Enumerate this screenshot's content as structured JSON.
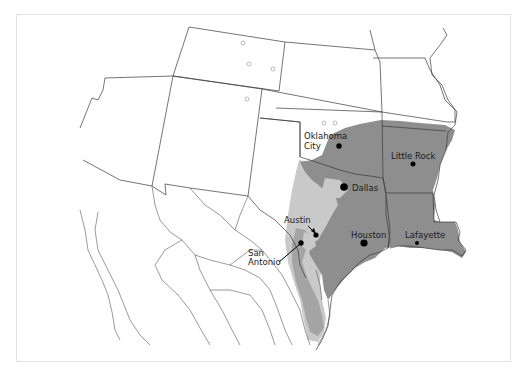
{
  "map": {
    "title": "",
    "colors": {
      "background": "#ffffff",
      "frame": "#e2e2e2",
      "border_line": "#3a3a3a",
      "dark_zone": "#8e8e8e",
      "medium_zone": "#a4a4a4",
      "light_zone": "#c9c9c9",
      "city_dot": "#000000"
    },
    "cities": [
      {
        "name": "Oklahoma City",
        "line1": "Oklahoma",
        "line2": "City",
        "x": 339,
        "y": 146
      },
      {
        "name": "Little Rock",
        "line1": "Little Rock",
        "x": 413,
        "y": 164
      },
      {
        "name": "Dallas",
        "line1": "Dallas",
        "x": 344,
        "y": 187
      },
      {
        "name": "Austin",
        "line1": "Austin",
        "x": 316,
        "y": 235
      },
      {
        "name": "San Antonio",
        "line1": "San",
        "line2": "Antonio",
        "x": 301,
        "y": 243
      },
      {
        "name": "Houston",
        "line1": "Houston",
        "x": 364,
        "y": 243
      },
      {
        "name": "Lafayette",
        "line1": "Lafayette",
        "x": 417,
        "y": 243
      }
    ],
    "hollow_markers": [
      {
        "x": 243,
        "y": 43
      },
      {
        "x": 249,
        "y": 64
      },
      {
        "x": 273,
        "y": 69
      },
      {
        "x": 247,
        "y": 99
      },
      {
        "x": 324,
        "y": 123
      },
      {
        "x": 335,
        "y": 123
      }
    ]
  }
}
